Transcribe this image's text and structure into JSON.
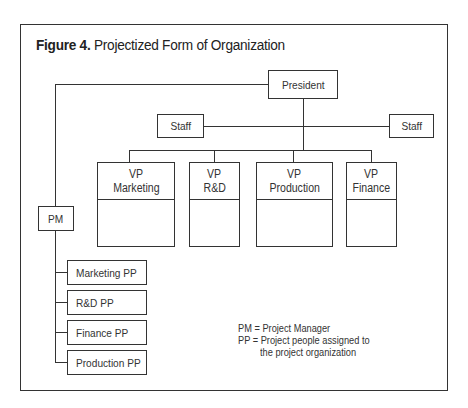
{
  "figure": {
    "label": "Figure 4.",
    "title": "Projectized Form of Organization"
  },
  "nodes": {
    "president": "President",
    "staff_left": "Staff",
    "staff_right": "Staff",
    "vps": [
      {
        "line1": "VP",
        "line2": "Marketing"
      },
      {
        "line1": "VP",
        "line2": "R&D"
      },
      {
        "line1": "VP",
        "line2": "Production"
      },
      {
        "line1": "VP",
        "line2": "Finance"
      }
    ],
    "pm": "PM",
    "project_people": [
      "Marketing PP",
      "R&D PP",
      "Finance PP",
      "Production PP"
    ]
  },
  "legend": {
    "line1": "PM = Project Manager",
    "line2": "PP  = Project people assigned to",
    "line3": "the project organization"
  }
}
